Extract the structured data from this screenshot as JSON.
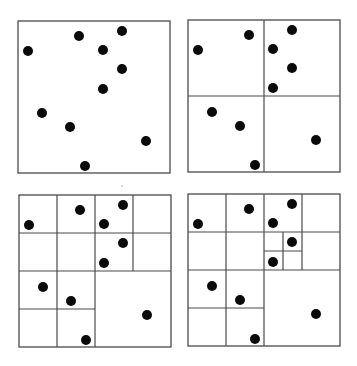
{
  "figure": {
    "title": "",
    "line_color": "#4a4a4a",
    "point_color": "#0a0a0a",
    "point_radius": 5,
    "panel_size": 152
  },
  "points": [
    [
      61,
      15
    ],
    [
      104,
      10
    ],
    [
      10,
      30
    ],
    [
      85,
      29
    ],
    [
      104,
      48
    ],
    [
      85,
      68
    ],
    [
      24,
      92
    ],
    [
      52,
      106
    ],
    [
      128,
      120
    ],
    [
      67,
      145
    ]
  ],
  "panels": [
    {
      "name": "panel-stage-0",
      "label": "No subdivision",
      "x": 18,
      "y": 21,
      "lines": []
    },
    {
      "name": "panel-stage-1",
      "label": "One level of subdivision",
      "x": 188,
      "y": 20,
      "lines": [
        [
          76,
          0,
          76,
          152
        ],
        [
          0,
          76,
          152,
          76
        ]
      ]
    },
    {
      "name": "panel-stage-2",
      "label": "Two levels of subdivision",
      "x": 19,
      "y": 195,
      "lines": [
        [
          76,
          0,
          76,
          152
        ],
        [
          0,
          76,
          152,
          76
        ],
        [
          38,
          0,
          38,
          152
        ],
        [
          114,
          0,
          114,
          76
        ],
        [
          0,
          38,
          76,
          38
        ],
        [
          76,
          38,
          152,
          38
        ],
        [
          0,
          114,
          76,
          114
        ]
      ]
    },
    {
      "name": "panel-stage-3",
      "label": "Three levels of subdivision",
      "x": 188,
      "y": 194,
      "lines": [
        [
          76,
          0,
          76,
          152
        ],
        [
          0,
          76,
          152,
          76
        ],
        [
          38,
          0,
          38,
          152
        ],
        [
          114,
          0,
          114,
          76
        ],
        [
          0,
          38,
          76,
          38
        ],
        [
          76,
          38,
          152,
          38
        ],
        [
          0,
          114,
          76,
          114
        ],
        [
          95,
          38,
          95,
          76
        ],
        [
          76,
          57,
          114,
          57
        ]
      ]
    }
  ],
  "artifacts": [
    {
      "x": 122,
      "y": 186,
      "r": 0.8
    }
  ]
}
